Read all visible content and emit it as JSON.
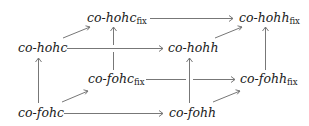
{
  "diagram": {
    "type": "commutative-cube",
    "nodes": [
      {
        "id": "hohc_fix",
        "base": "co-hohc",
        "sub": "fix",
        "x": 87,
        "y": 12
      },
      {
        "id": "hohh_fix",
        "base": "co-hohh",
        "sub": "fix",
        "x": 239,
        "y": 12
      },
      {
        "id": "hohc",
        "base": "co-hohc",
        "sub": "",
        "x": 18,
        "y": 42
      },
      {
        "id": "hohh",
        "base": "co-hohh",
        "sub": "",
        "x": 168,
        "y": 42
      },
      {
        "id": "fohc_fix",
        "base": "co-fohc",
        "sub": "fix",
        "x": 88,
        "y": 73
      },
      {
        "id": "fohh_fix",
        "base": "co-fohh",
        "sub": "fix",
        "x": 240,
        "y": 73
      },
      {
        "id": "fohc",
        "base": "co-fohc",
        "sub": "",
        "x": 18,
        "y": 107
      },
      {
        "id": "fohh",
        "base": "co-fohh",
        "sub": "",
        "x": 169,
        "y": 107
      }
    ],
    "edges": [
      {
        "from": "hohc_fix",
        "to": "hohh_fix"
      },
      {
        "from": "hohc",
        "to": "hohc_fix"
      },
      {
        "from": "hohh",
        "to": "hohh_fix"
      },
      {
        "from": "hohc",
        "to": "hohh"
      },
      {
        "from": "fohc_fix",
        "to": "hohc_fix"
      },
      {
        "from": "fohh_fix",
        "to": "hohh_fix"
      },
      {
        "from": "fohc_fix",
        "to": "fohh_fix"
      },
      {
        "from": "fohc",
        "to": "hohc"
      },
      {
        "from": "fohh",
        "to": "hohh"
      },
      {
        "from": "fohc",
        "to": "fohc_fix"
      },
      {
        "from": "fohh",
        "to": "fohh_fix"
      },
      {
        "from": "fohc",
        "to": "fohh"
      }
    ]
  },
  "labels": {
    "hohc_fix": "co-hohc",
    "hohh_fix": "co-hohh",
    "hohc": "co-hohc",
    "hohh": "co-hohh",
    "fohc_fix": "co-fohc",
    "fohh_fix": "co-fohh",
    "fohc": "co-fohc",
    "fohh": "co-fohh",
    "fix": "fix"
  }
}
